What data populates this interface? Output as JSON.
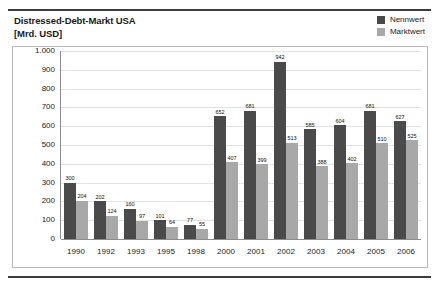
{
  "chart_data": {
    "type": "bar",
    "title": "Distressed-Debt-Markt USA\n[Mrd. USD]",
    "title_line1": "Distressed-Debt-Markt USA",
    "title_line2": "[Mrd. USD]",
    "xlabel": "",
    "ylabel": "Mrd. USD",
    "ylim": [
      0,
      1000
    ],
    "ytick_values": [
      1000,
      900,
      800,
      700,
      600,
      500,
      400,
      300,
      200,
      100,
      0
    ],
    "ytick_labels": [
      "1.000",
      "900",
      "800",
      "700",
      "600",
      "500",
      "400",
      "300",
      "200",
      "100",
      "0"
    ],
    "grid": true,
    "legend_position": "top-right",
    "categories": [
      "1990",
      "1992",
      "1993",
      "1995",
      "1998",
      "2000",
      "2001",
      "2002",
      "2003",
      "2004",
      "2005",
      "2006"
    ],
    "series": [
      {
        "name": "Nennwert",
        "color": "#4a4a4a",
        "values": [
          300,
          202,
          160,
          101,
          77,
          652,
          681,
          942,
          585,
          604,
          681,
          627
        ]
      },
      {
        "name": "Marktwert",
        "color": "#a8a8a8",
        "values": [
          204,
          124,
          97,
          64,
          55,
          407,
          399,
          513,
          388,
          402,
          510,
          525
        ]
      }
    ]
  },
  "legend": {
    "items": [
      {
        "label": "Nennwert",
        "color": "#4a4a4a"
      },
      {
        "label": "Marktwert",
        "color": "#a8a8a8"
      }
    ]
  }
}
